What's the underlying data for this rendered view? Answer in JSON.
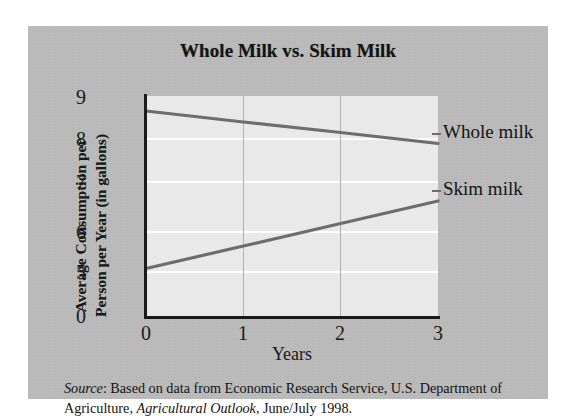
{
  "figure": {
    "title": "Whole Milk vs. Skim Milk",
    "source_prefix": "Source",
    "source_line1_rest": ": Based on data from Economic Research Service, U.S.",
    "source_line2_pre": "Department of Agriculture, ",
    "source_italic": "Agricultural Outlook",
    "source_line2_post": ", June/July 1998."
  },
  "chart_data": {
    "type": "line",
    "title": "Whole Milk vs. Skim Milk",
    "xlabel": "Years",
    "ylabel": "Average Consumption per Person per Year (in gallons)",
    "ylabel_line1": "Average Consumption per",
    "ylabel_line2": "Person per Year (in gallons)",
    "x": [
      0,
      1,
      2,
      3
    ],
    "xticklabels": [
      "0",
      "1",
      "2",
      "3"
    ],
    "yticklabels": [
      "9",
      "8",
      "7",
      "6",
      "5",
      "0"
    ],
    "ytickvalues": [
      9,
      8,
      7,
      6,
      5,
      0
    ],
    "xlim": [
      0,
      3
    ],
    "ylim": [
      4.6,
      9
    ],
    "axis_broken": true,
    "grid": "horizontal-white-and-vertical-gray",
    "legend_position": "right-of-plot-inline-labels",
    "line_color": "#6d6d6d",
    "plot_background": "#e9e9e9",
    "card_background": "#b9b9b9",
    "series": [
      {
        "name": "Whole milk",
        "label": "Whole milk",
        "values": [
          8.7,
          8.48,
          8.27,
          8.05
        ],
        "color": "#6d6d6d"
      },
      {
        "name": "Skim milk",
        "label": "Skim milk",
        "values": [
          5.55,
          6.0,
          6.45,
          6.9
        ],
        "color": "#6d6d6d"
      }
    ]
  }
}
